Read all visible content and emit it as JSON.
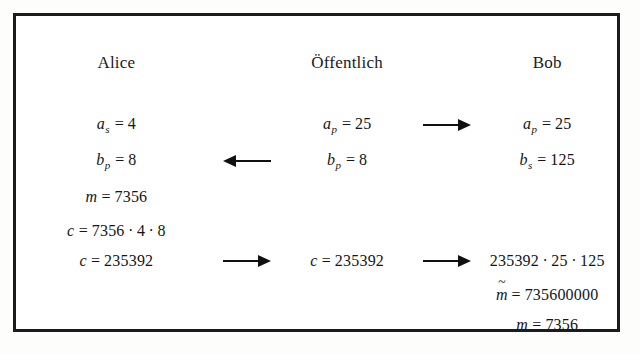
{
  "figure": {
    "columns": {
      "alice": "Alice",
      "public": "Öffentlich",
      "bob": "Bob"
    },
    "colors": {
      "border": "#1c1c1c",
      "text": "#151515",
      "paper": "#fdfdfc",
      "panel": "#ffffff"
    },
    "rows": [
      {
        "id": "row-public-key-a",
        "alice": {
          "var": "a",
          "sub": "s",
          "eq": "=",
          "value": "4"
        },
        "arrow_a": "none",
        "public": {
          "var": "a",
          "sub": "p",
          "eq": "=",
          "value": "25"
        },
        "arrow_b": "right",
        "bob": {
          "var": "a",
          "sub": "p",
          "eq": "=",
          "value": "25"
        }
      },
      {
        "id": "row-public-key-b",
        "alice": {
          "var": "b",
          "sub": "p",
          "eq": "=",
          "value": "8"
        },
        "arrow_a": "left",
        "public": {
          "var": "b",
          "sub": "p",
          "eq": "=",
          "value": "8"
        },
        "arrow_b": "none",
        "bob": {
          "var": "b",
          "sub": "s",
          "eq": "=",
          "value": "125"
        }
      },
      {
        "id": "row-message",
        "alice": {
          "var": "m",
          "sub": "",
          "eq": "=",
          "value": "7356"
        },
        "arrow_a": "none",
        "public": null,
        "arrow_b": "none",
        "bob": null
      },
      {
        "id": "row-encrypt",
        "alice": {
          "var": "c",
          "sub": "",
          "eq": "=",
          "value": "7356",
          "factors": [
            "4",
            "8"
          ]
        },
        "arrow_a": "none",
        "public": null,
        "arrow_b": "none",
        "bob": null
      },
      {
        "id": "row-ciphertext",
        "alice": {
          "var": "c",
          "sub": "",
          "eq": "=",
          "value": "235392"
        },
        "arrow_a": "right",
        "public": {
          "var": "c",
          "sub": "",
          "eq": "=",
          "value": "235392"
        },
        "arrow_b": "right",
        "bob": {
          "var": "",
          "sub": "",
          "eq": "",
          "value": "235392",
          "factors": [
            "25",
            "125"
          ]
        }
      },
      {
        "id": "row-decrypt-intermediate",
        "alice": null,
        "arrow_a": "none",
        "public": null,
        "arrow_b": "none",
        "bob": {
          "var": "m",
          "sub": "",
          "accent": "~",
          "eq": "=",
          "value": "735600000"
        }
      },
      {
        "id": "row-decrypt-final",
        "alice": null,
        "arrow_a": "none",
        "public": null,
        "arrow_b": "none",
        "bob": {
          "var": "m",
          "sub": "",
          "eq": "=",
          "value": "7356"
        }
      }
    ],
    "glyphs": {
      "multiplication_dot": "·",
      "equals": "=",
      "tilde": "~"
    }
  }
}
